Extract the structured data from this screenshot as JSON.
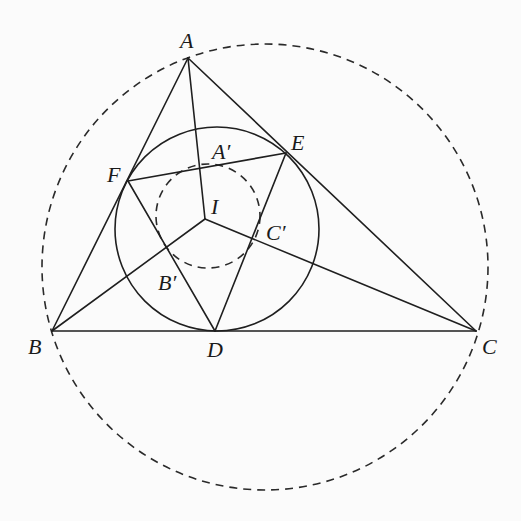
{
  "diagram": {
    "type": "geometry",
    "colors": {
      "stroke": "#1f1f1f",
      "background": "#fbfbfb"
    },
    "points": {
      "A": {
        "label": "A",
        "x": 188,
        "y": 58,
        "lx": 180,
        "ly": 48
      },
      "B": {
        "label": "B",
        "x": 52,
        "y": 331,
        "lx": 28,
        "ly": 354
      },
      "C": {
        "label": "C",
        "x": 476,
        "y": 331,
        "lx": 482,
        "ly": 354
      },
      "D": {
        "label": "D",
        "x": 215,
        "y": 331,
        "lx": 207,
        "ly": 357
      },
      "E": {
        "label": "E",
        "x": 286,
        "y": 153,
        "lx": 291,
        "ly": 150
      },
      "F": {
        "label": "F",
        "x": 128,
        "y": 181,
        "lx": 107,
        "ly": 182
      },
      "I": {
        "label": "I",
        "x": 205,
        "y": 219,
        "lx": 211,
        "ly": 214
      },
      "A1": {
        "label": "A′",
        "x": 200,
        "y": 167,
        "lx": 212,
        "ly": 159
      },
      "B1": {
        "label": "B′",
        "x": 166,
        "y": 247,
        "lx": 158,
        "ly": 290
      },
      "C1": {
        "label": "C′",
        "x": 251,
        "y": 236,
        "lx": 266,
        "ly": 240
      }
    },
    "segments": [
      [
        "A",
        "B"
      ],
      [
        "B",
        "C"
      ],
      [
        "C",
        "A"
      ],
      [
        "A",
        "I"
      ],
      [
        "B",
        "I"
      ],
      [
        "C",
        "I"
      ],
      [
        "F",
        "E"
      ],
      [
        "E",
        "D"
      ],
      [
        "D",
        "F"
      ]
    ],
    "circles": [
      {
        "name": "circumcircle",
        "cx": 265,
        "cy": 267,
        "r": 223,
        "style": "dashed"
      },
      {
        "name": "incircle",
        "cx": 217,
        "cy": 229,
        "r": 102,
        "style": "solid"
      },
      {
        "name": "small-circle",
        "cx": 208,
        "cy": 216,
        "r": 52,
        "style": "dashed"
      }
    ]
  }
}
